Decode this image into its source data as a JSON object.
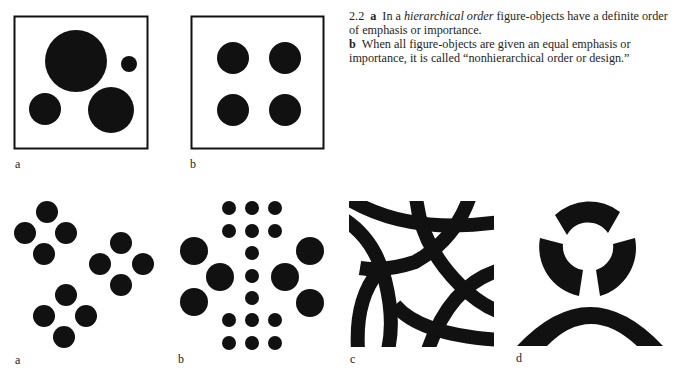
{
  "caption": {
    "number": "2.2",
    "a_letter": "a",
    "a_pre": "In a ",
    "a_em": "hierarchical order",
    "a_post": " figure-objects have a definite order of emphasis or importance.",
    "b_letter": "b",
    "b_text": "When all figure-objects are given an equal emphasis or importance, it is called “nonhierarchical order or design.”"
  },
  "top_row": {
    "panel_a": {
      "label": "a",
      "shapes": "4 circles of differing sizes in a square frame (hierarchical)"
    },
    "panel_b": {
      "label": "b",
      "shapes": "4 equal circles in a square frame (nonhierarchical)"
    }
  },
  "bottom_row": {
    "panel_a": {
      "label": "a",
      "shapes": "3 diamond clusters of 4 equal circles"
    },
    "panel_b": {
      "label": "b",
      "shapes": "symmetric arrangement of small dots and 6 large circles"
    },
    "panel_c": {
      "label": "c",
      "shapes": "interlaced thick curved bands in a square"
    },
    "panel_d": {
      "label": "d",
      "shapes": "three ring segments above a wide arch"
    }
  },
  "colors": {
    "ink": "#111111",
    "paper": "#ffffff"
  }
}
